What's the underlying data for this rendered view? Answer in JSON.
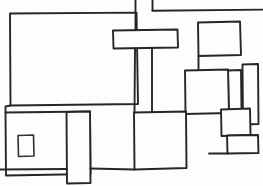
{
  "canvas": {
    "width": 263,
    "height": 186,
    "background_color": "#fdfdfc",
    "ink_color": "#262626",
    "title": "Hand-drawn rectangle block sketch"
  },
  "shapes": [
    {
      "name": "large-left-panel",
      "kind": "rectangle",
      "path": "M10 13.5 L136.5 12.6 L138 104 L10.5 105.5 Z"
    },
    {
      "name": "top-middle-bar",
      "kind": "rectangle",
      "path": "M113 30.5 L177.5 29.5 L178 47.5 L113.5 48.5 Z"
    },
    {
      "name": "top-right-frame",
      "kind": "rectangle",
      "path": "M152.5 10.5 L262.5 9.5"
    },
    {
      "name": "upper-right-panel",
      "kind": "rectangle",
      "path": "M198 22.5 L240 21.5 L241 55 L198.5 56 Z"
    },
    {
      "name": "connector-left-stub",
      "kind": "line",
      "path": "M135.5 0 L135.5 30.5"
    },
    {
      "name": "connector-right-stub",
      "kind": "line",
      "path": "M152.5 0 L152.5 10.5"
    },
    {
      "name": "connector-bar-left-down",
      "kind": "line",
      "path": "M135 48.5 L134.5 112"
    },
    {
      "name": "connector-bar-right-down",
      "kind": "line",
      "path": "M152 48.5 L152 112"
    },
    {
      "name": "connector-upper-right-down",
      "kind": "line",
      "path": "M198.5 56 L198.5 69"
    },
    {
      "name": "mid-right-panel",
      "kind": "rectangle",
      "path": "M185 70.5 L228 69.5 L229 113 L185.5 114 Z"
    },
    {
      "name": "narrow-tall-left",
      "kind": "rectangle",
      "path": "M228 70.5 L241 70 L241.5 110 L228.5 110.5 Z"
    },
    {
      "name": "narrow-tall-right",
      "kind": "rectangle",
      "path": "M242.5 64.5 L258 64 L258.5 124 L243 124.5 Z"
    },
    {
      "name": "right-square-panel",
      "kind": "rectangle",
      "path": "M221 109.5 L250 108.5 L250.5 135 L221.5 136 Z"
    },
    {
      "name": "bottom-right-shelf",
      "kind": "rectangle",
      "path": "M227 135.5 L258 135 L258.5 153 L227.5 153.5 Z"
    },
    {
      "name": "mid-bottom-panel",
      "kind": "rectangle",
      "path": "M134 112.5 L186 111.5 L186.5 168 L134.5 169.5 Z"
    },
    {
      "name": "bottom-left-panel",
      "kind": "rectangle",
      "path": "M5.5 112.5 L90 111.5 L90.5 174 L6 175.5 Z"
    },
    {
      "name": "bottom-left-inner-square",
      "kind": "rectangle",
      "path": "M18 135.5 L33.5 135 L34 156 L18.5 156.5 Z"
    },
    {
      "name": "bottom-narrow-column",
      "kind": "rectangle",
      "path": "M66.5 112 L90 111.5 L90.5 183 L67 183.5 Z"
    },
    {
      "name": "bottom-left-notch",
      "kind": "line",
      "path": "M5.5 112.5 L5.5 106.5 L10.5 105.5"
    },
    {
      "name": "bottom-baseline-left",
      "kind": "line",
      "path": "M0 169.5 L67 169"
    },
    {
      "name": "bottom-baseline-right",
      "kind": "line",
      "path": "M90.5 168.5 L134.5 169.5"
    },
    {
      "name": "right-edge-bracket",
      "kind": "line",
      "path": "M209 153.5 L227.5 153.5"
    }
  ]
}
